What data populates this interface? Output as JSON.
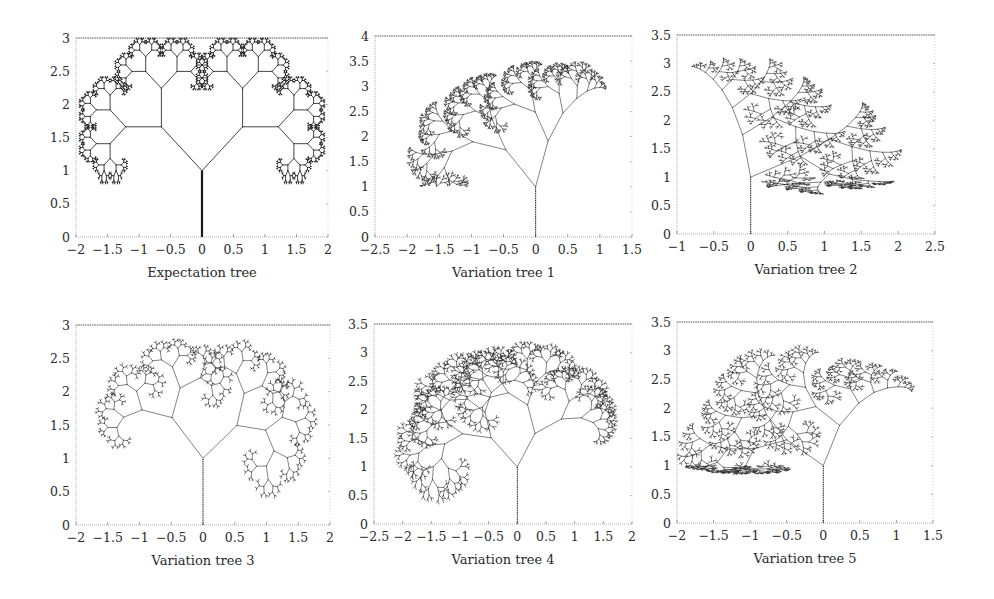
{
  "chart_data": [
    {
      "type": "scatter",
      "subtype": "fractal-tree",
      "title": "Expectation tree",
      "xlim": [
        -2,
        2
      ],
      "ylim": [
        0,
        3
      ],
      "xticks": [
        "-2",
        "-1.5",
        "-1",
        "-0.5",
        "0",
        "0.5",
        "1",
        "1.5",
        "2"
      ],
      "yticks": [
        "0",
        "0.5",
        "1",
        "1.5",
        "2",
        "2.5",
        "3"
      ],
      "xlabel": "",
      "ylabel": "",
      "grid": false,
      "trunk": {
        "x": 0,
        "y0": 0,
        "y1": 1
      },
      "tree": {
        "angle_left": 45,
        "angle_right": 45,
        "scale_left": 0.62,
        "scale_right": 0.62,
        "first_len": 0.72,
        "depth": 10,
        "asym": 0,
        "jitter": 0,
        "seed": 1
      },
      "extent": {
        "x": [
          -1.95,
          1.95
        ],
        "y": [
          0.8,
          3.0
        ]
      }
    },
    {
      "type": "scatter",
      "subtype": "fractal-tree",
      "title": "Variation tree 1",
      "xlim": [
        -2.5,
        1.5
      ],
      "ylim": [
        0,
        4
      ],
      "xticks": [
        "-2.5",
        "-2",
        "-1.5",
        "-1",
        "-0.5",
        "0",
        "0.5",
        "1",
        "1.5"
      ],
      "yticks": [
        "0",
        "0.5",
        "1",
        "1.5",
        "2",
        "2.5",
        "3",
        "3.5",
        "4"
      ],
      "xlabel": "",
      "ylabel": "",
      "grid": false,
      "trunk": {
        "x": 0,
        "y0": 0,
        "y1": 1
      },
      "tree": {
        "angle_left": 40,
        "angle_right": 15,
        "scale_left": 0.7,
        "scale_right": 0.6,
        "first_len": 1.0,
        "depth": 10,
        "asym": 0.6,
        "jitter": 0.25,
        "seed": 7
      },
      "extent": {
        "x": [
          -2.0,
          1.1
        ],
        "y": [
          1.3,
          3.5
        ]
      }
    },
    {
      "type": "scatter",
      "subtype": "fractal-tree",
      "title": "Variation tree 2",
      "xlim": [
        -1,
        2.5
      ],
      "ylim": [
        0,
        3.5
      ],
      "xticks": [
        "-1",
        "-0.5",
        "0",
        "0.5",
        "1",
        "1.5",
        "2",
        "2.5"
      ],
      "yticks": [
        "0",
        "0.5",
        "1",
        "1.5",
        "2",
        "2.5",
        "3",
        "3.5"
      ],
      "xlabel": "",
      "ylabel": "",
      "grid": false,
      "trunk": {
        "x": 0,
        "y0": 0,
        "y1": 1
      },
      "tree": {
        "angle_left": 10,
        "angle_right": 60,
        "scale_left": 0.62,
        "scale_right": 0.72,
        "first_len": 0.7,
        "depth": 10,
        "asym": -0.5,
        "jitter": 0.25,
        "seed": 13
      },
      "extent": {
        "x": [
          -0.8,
          2.05
        ],
        "y": [
          0.7,
          3.1
        ]
      }
    },
    {
      "type": "scatter",
      "subtype": "fractal-tree",
      "title": "Variation tree 3",
      "xlim": [
        -2,
        2
      ],
      "ylim": [
        0,
        3
      ],
      "xticks": [
        "-2",
        "-1.5",
        "-1",
        "-0.5",
        "0",
        "0.5",
        "1",
        "1.5",
        "2"
      ],
      "yticks": [
        "0",
        "0.5",
        "1",
        "1.5",
        "2",
        "2.5",
        "3"
      ],
      "xlabel": "",
      "ylabel": "",
      "grid": false,
      "trunk": {
        "x": 0,
        "y0": 0,
        "y1": 1
      },
      "tree": {
        "angle_left": 40,
        "angle_right": 55,
        "scale_left": 0.66,
        "scale_right": 0.66,
        "first_len": 0.7,
        "depth": 9,
        "asym": 0,
        "jitter": 0.3,
        "seed": 21
      },
      "extent": {
        "x": [
          -1.7,
          1.8
        ],
        "y": [
          0.4,
          2.8
        ]
      }
    },
    {
      "type": "scatter",
      "subtype": "fractal-tree",
      "title": "Variation tree 4",
      "xlim": [
        -2.5,
        2
      ],
      "ylim": [
        0,
        3.5
      ],
      "xticks": [
        "-2.5",
        "-2",
        "-1.5",
        "-1",
        "-0.5",
        "0",
        "0.5",
        "1",
        "1.5",
        "2"
      ],
      "yticks": [
        "0",
        "0.5",
        "1",
        "1.5",
        "2",
        "2.5",
        "3",
        "3.5"
      ],
      "xlabel": "",
      "ylabel": "",
      "grid": false,
      "trunk": {
        "x": 0,
        "y0": 0,
        "y1": 1
      },
      "tree": {
        "angle_left": 42,
        "angle_right": 30,
        "scale_left": 0.72,
        "scale_right": 0.7,
        "first_len": 0.75,
        "depth": 10,
        "asym": 0.3,
        "jitter": 0.3,
        "seed": 33
      },
      "extent": {
        "x": [
          -2.15,
          1.75
        ],
        "y": [
          0.35,
          3.2
        ]
      }
    },
    {
      "type": "scatter",
      "subtype": "fractal-tree",
      "title": "Variation tree 5",
      "xlim": [
        -2,
        1.5
      ],
      "ylim": [
        0,
        3.5
      ],
      "xticks": [
        "-2",
        "-1.5",
        "-1",
        "-0.5",
        "0",
        "0.5",
        "1",
        "1.5"
      ],
      "yticks": [
        "0",
        "0.5",
        "1",
        "1.5",
        "2",
        "2.5",
        "3",
        "3.5"
      ],
      "xlabel": "",
      "ylabel": "",
      "grid": false,
      "trunk": {
        "x": 0,
        "y0": 0,
        "y1": 1
      },
      "tree": {
        "angle_left": 55,
        "angle_right": 18,
        "scale_left": 0.72,
        "scale_right": 0.66,
        "first_len": 0.75,
        "depth": 10,
        "asym": 0.4,
        "jitter": 0.3,
        "seed": 45
      },
      "extent": {
        "x": [
          -2.0,
          1.25
        ],
        "y": [
          0.85,
          3.1
        ]
      }
    }
  ],
  "layout": {
    "panels": [
      {
        "left": 76,
        "top": 38,
        "width": 252,
        "height": 199
      },
      {
        "left": 375,
        "top": 36,
        "width": 257,
        "height": 201
      },
      {
        "left": 677,
        "top": 35,
        "width": 258,
        "height": 199
      },
      {
        "left": 76,
        "top": 325,
        "width": 254,
        "height": 200
      },
      {
        "left": 374,
        "top": 324,
        "width": 258,
        "height": 200
      },
      {
        "left": 677,
        "top": 322,
        "width": 256,
        "height": 201
      }
    ]
  },
  "colors": {
    "ink": "#1a1a1a",
    "axis": "#555555",
    "background": "#ffffff"
  }
}
